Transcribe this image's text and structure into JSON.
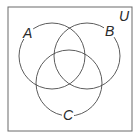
{
  "diagram": {
    "type": "venn",
    "universe_label": "U",
    "sets": [
      {
        "label": "A"
      },
      {
        "label": "B"
      },
      {
        "label": "C"
      }
    ],
    "colors": {
      "stroke": "#4a4a4a",
      "background": "#ffffff",
      "text": "#2a2a2a"
    }
  }
}
